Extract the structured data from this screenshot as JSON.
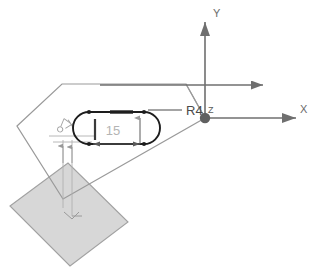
{
  "diagram": {
    "background_color": "#ffffff"
  },
  "axes": {
    "origin_label": "Z",
    "y_label": "Y",
    "x_label": "X",
    "axis_color": "#6f6f6f",
    "origin_dot_color": "#606060"
  },
  "annotations": {
    "radius_label": "R4",
    "length_label": "15",
    "small_callout": "",
    "radius_color": "#4a4a4a",
    "length_color": "#b4b4b4"
  },
  "shapes": {
    "outline_polygon_color": "#9a9a9a",
    "filled_square_fill": "#d4d4d4",
    "filled_square_stroke": "#9a9a9a",
    "slot_stroke": "#1d1d1d",
    "dimension_line_color": "#8f8f8f",
    "extension_line_color": "#b0b0b0"
  }
}
